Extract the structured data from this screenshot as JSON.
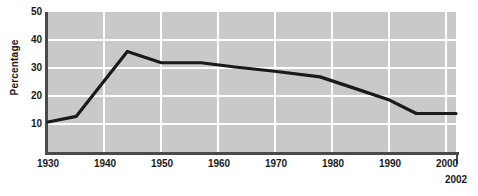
{
  "chart_data": {
    "type": "line",
    "title": "",
    "subtitle": "",
    "xlabel": "",
    "ylabel": "Percentage",
    "xlim": [
      1930,
      2002
    ],
    "ylim": [
      0,
      50
    ],
    "grid": true,
    "legend": null,
    "x_ticks": [
      "1930",
      "1940",
      "1950",
      "1960",
      "1970",
      "1980",
      "1990",
      "2000"
    ],
    "x_tick_values": [
      1930,
      1940,
      1950,
      1960,
      1970,
      1980,
      1990,
      2000
    ],
    "x_end_label": "2002",
    "y_ticks": [
      "10",
      "20",
      "30",
      "40",
      "50"
    ],
    "y_tick_values": [
      10,
      20,
      30,
      40,
      50
    ],
    "series": [
      {
        "name": "Percentage",
        "color": "#1a1a1a",
        "x": [
          1930,
          1935,
          1944,
          1950,
          1957,
          1963,
          1970,
          1978,
          1984,
          1990,
          1995,
          2000,
          2002
        ],
        "values": [
          11,
          13,
          36,
          32,
          32,
          30.5,
          29,
          27,
          23,
          19,
          14,
          14,
          14
        ]
      }
    ],
    "colors": {
      "plot_background": "#c9c9c9",
      "gridline": "#ffffff",
      "axis": "#4a4a4a",
      "line": "#1a1a1a",
      "page_background": "#ffffff",
      "text": "#1a1a1a"
    }
  }
}
